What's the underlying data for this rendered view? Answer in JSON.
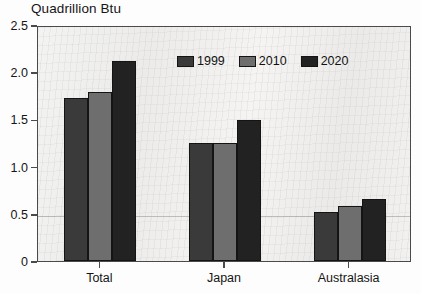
{
  "chart_data": {
    "type": "bar",
    "title": "Quadrillion Btu",
    "xlabel": "",
    "ylabel": "",
    "categories": [
      "Total",
      "Japan",
      "Australasia"
    ],
    "series": [
      {
        "name": "1999",
        "color": "#3a3a3a",
        "values": [
          1.73,
          1.25,
          0.52
        ]
      },
      {
        "name": "2010",
        "color": "#6e6e6e",
        "values": [
          1.79,
          1.25,
          0.58
        ]
      },
      {
        "name": "2020",
        "color": "#222222",
        "values": [
          2.12,
          1.49,
          0.66
        ]
      }
    ],
    "ylim": [
      0,
      2.5
    ],
    "ytick_labels": [
      "0",
      "0.5",
      "1.0",
      "1.5",
      "2.0",
      "2.5"
    ],
    "ytick_values": [
      0,
      0.5,
      1.0,
      1.5,
      2.0,
      2.5
    ],
    "grid": "single faint horizontal line at 0.5",
    "gridline_values": [
      0.5
    ],
    "legend_position": "top-center inside plot",
    "frame_color": "#4a4a4a",
    "plot_background": "#f0efee"
  }
}
